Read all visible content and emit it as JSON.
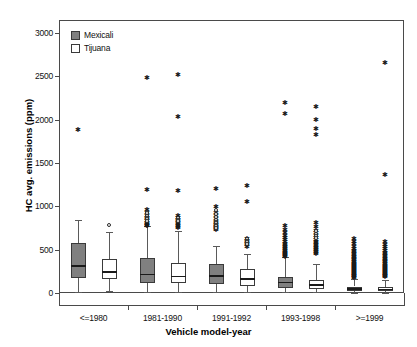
{
  "chart_data": {
    "type": "box",
    "title": "",
    "xlabel": "Vehicle model-year",
    "ylabel": "HC avg. emissions (ppm)",
    "ylim": [
      0,
      3150
    ],
    "yticks": [
      0,
      500,
      1000,
      1500,
      2000,
      2500,
      3000
    ],
    "ytick_labels": [
      "0",
      "500",
      "1000",
      "1500",
      "2000",
      "2500",
      "3000"
    ],
    "grid": false,
    "legend_position": "upper-left-inside",
    "categories": [
      "<=1980",
      "1981-1990",
      "1991-1992",
      "1993-1998",
      ">=1999"
    ],
    "series": [
      {
        "name": "Mexicali",
        "fill": "#808080",
        "boxes": [
          {
            "category": "<=1980",
            "whisker_low": 10,
            "q1": 170,
            "median": 310,
            "q3": 575,
            "whisker_high": 840,
            "outliers_star": [
              1890
            ],
            "outliers_circle": []
          },
          {
            "category": "1981-1990",
            "whisker_low": 10,
            "q1": 120,
            "median": 215,
            "q3": 400,
            "whisker_high": 770,
            "outliers_star": [
              2490,
              1200,
              965,
              930,
              905,
              880,
              860,
              845,
              825,
              810,
              800,
              790,
              782
            ],
            "outliers_circle": [
              940,
              918,
              892,
              868,
              852,
              835
            ]
          },
          {
            "category": "1991-1992",
            "whisker_low": 10,
            "q1": 100,
            "median": 195,
            "q3": 330,
            "whisker_high": 540,
            "outliers_star": [
              1210,
              1000,
              930,
              900,
              860,
              835,
              815,
              800,
              788,
              775,
              762,
              748,
              735
            ],
            "outliers_circle": [
              955,
              912,
              880,
              845,
              822,
              805,
              790,
              770,
              755
            ]
          },
          {
            "category": "1993-1998",
            "whisker_low": 8,
            "q1": 60,
            "median": 120,
            "q3": 190,
            "whisker_high": 420,
            "outliers_star": [
              2200,
              2080,
              780,
              740,
              705,
              672,
              645,
              620,
              600,
              580,
              562,
              545,
              530,
              515,
              500,
              487,
              474,
              462,
              450,
              440,
              430
            ],
            "outliers_circle": []
          },
          {
            "category": ">=1999",
            "whisker_low": 5,
            "q1": 20,
            "median": 45,
            "q3": 75,
            "whisker_high": 160,
            "outliers_star": [
              640,
              605,
              575,
              548,
              522,
              500,
              480,
              462,
              445,
              430,
              415,
              400,
              388,
              375,
              362,
              350,
              338,
              326,
              314,
              302,
              290,
              278,
              266,
              255,
              244,
              233,
              222,
              212,
              202,
              192,
              182
            ],
            "outliers_circle": []
          }
        ]
      },
      {
        "name": "Tijuana",
        "fill": "#ffffff",
        "boxes": [
          {
            "category": "<=1980",
            "whisker_low": 25,
            "q1": 165,
            "median": 245,
            "q3": 390,
            "whisker_high": 700,
            "outliers_star": [],
            "outliers_circle": [
              785
            ]
          },
          {
            "category": "1981-1990",
            "whisker_low": 10,
            "q1": 110,
            "median": 190,
            "q3": 345,
            "whisker_high": 720,
            "outliers_star": [
              2530,
              2040,
              1190,
              905,
              880,
              858,
              840,
              822,
              805,
              790,
              776,
              762
            ],
            "outliers_circle": [
              868,
              848,
              830
            ]
          },
          {
            "category": "1991-1992",
            "whisker_low": 10,
            "q1": 85,
            "median": 160,
            "q3": 280,
            "whisker_high": 450,
            "outliers_star": [
              1250,
              1060,
              640,
              615,
              595,
              578,
              562,
              548
            ],
            "outliers_circle": [
              625,
              604,
              586,
              570
            ]
          },
          {
            "category": "1993-1998",
            "whisker_low": 8,
            "q1": 45,
            "median": 95,
            "q3": 150,
            "whisker_high": 330,
            "outliers_star": [
              2160,
              2010,
              1900,
              1840,
              820,
              770,
              730,
              700,
              672,
              648,
              625,
              605,
              586,
              568,
              550,
              534,
              518,
              503,
              488,
              474,
              460
            ],
            "outliers_circle": [
              712,
              686,
              660,
              638
            ]
          },
          {
            "category": ">=1999",
            "whisker_low": 5,
            "q1": 18,
            "median": 42,
            "q3": 70,
            "whisker_high": 150,
            "outliers_star": [
              2660,
              1370,
              600,
              570,
              545,
              520,
              498,
              478,
              458,
              440,
              424,
              408,
              392,
              378,
              364,
              350,
              337,
              324,
              312,
              300,
              288,
              276,
              265,
              254,
              243,
              232,
              222,
              212,
              202,
              192
            ],
            "outliers_circle": []
          }
        ]
      }
    ]
  },
  "legend": {
    "entries": [
      {
        "label": "Mexicali",
        "swatch": "#808080"
      },
      {
        "label": "Tijuana",
        "swatch": "#ffffff"
      }
    ]
  },
  "colors": {
    "mexicali_fill": "#808080",
    "tijuana_fill": "#ffffff",
    "axis": "#4a4a4a",
    "marker": "#1a1a1a"
  }
}
